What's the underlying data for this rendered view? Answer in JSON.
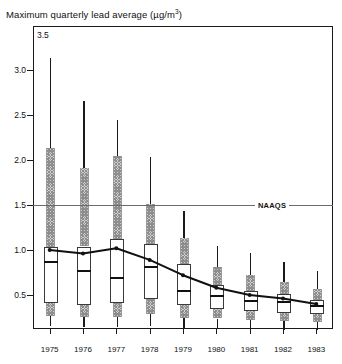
{
  "chart_data": {
    "type": "boxplot",
    "title_main": "Maximum quarterly lead average (µg/m",
    "title_sup": "3",
    "title_tail": ")",
    "xlabel": "",
    "ylabel": "Maximum quarterly lead average (µg/m3)",
    "ylim": [
      0,
      3.5
    ],
    "yticks": [
      3.5,
      3.0,
      2.5,
      2.0,
      1.5,
      1.0,
      0.5
    ],
    "ytick_labels": [
      "3.5",
      "3.0",
      "2.5",
      "2.0",
      "1.5",
      "1.0",
      "0.5"
    ],
    "categories": [
      "1975",
      "1976",
      "1977",
      "1978",
      "1979",
      "1980",
      "1981",
      "1982",
      "1983"
    ],
    "grid": false,
    "legend_position": "none",
    "annotations": [
      {
        "name": "NAAQS",
        "label": "NAAQS",
        "type": "hline",
        "value": 1.5,
        "color": "#6b6b6b"
      }
    ],
    "boxes": [
      {
        "category": "1975",
        "whisker_high": 3.15,
        "band_high": 2.15,
        "q3": 1.05,
        "median": 0.88,
        "q1": 0.42,
        "band_low": 0.28,
        "whisker_low": 0.17
      },
      {
        "category": "1976",
        "whisker_high": 2.67,
        "band_high": 1.92,
        "q3": 1.05,
        "median": 0.78,
        "q1": 0.4,
        "band_low": 0.27,
        "whisker_low": 0.16
      },
      {
        "category": "1977",
        "whisker_high": 2.46,
        "band_high": 2.06,
        "q3": 1.13,
        "median": 0.7,
        "q1": 0.42,
        "band_low": 0.27,
        "whisker_low": 0.15
      },
      {
        "category": "1978",
        "whisker_high": 2.05,
        "band_high": 1.52,
        "q3": 1.08,
        "median": 0.82,
        "q1": 0.47,
        "band_low": 0.3,
        "whisker_low": 0.17
      },
      {
        "category": "1979",
        "whisker_high": 1.45,
        "band_high": 1.14,
        "q3": 0.86,
        "median": 0.56,
        "q1": 0.4,
        "band_low": 0.26,
        "whisker_low": 0.14
      },
      {
        "category": "1980",
        "whisker_high": 1.06,
        "band_high": 0.82,
        "q3": 0.62,
        "median": 0.5,
        "q1": 0.36,
        "band_low": 0.25,
        "whisker_low": 0.14
      },
      {
        "category": "1981",
        "whisker_high": 0.98,
        "band_high": 0.73,
        "q3": 0.56,
        "median": 0.45,
        "q1": 0.33,
        "band_low": 0.23,
        "whisker_low": 0.13
      },
      {
        "category": "1982",
        "whisker_high": 0.88,
        "band_high": 0.66,
        "q3": 0.52,
        "median": 0.43,
        "q1": 0.31,
        "band_low": 0.22,
        "whisker_low": 0.12
      },
      {
        "category": "1983",
        "whisker_high": 0.78,
        "band_high": 0.58,
        "q3": 0.46,
        "median": 0.39,
        "q1": 0.3,
        "band_low": 0.21,
        "whisker_low": 0.12
      }
    ],
    "series": [
      {
        "name": "mean",
        "type": "line",
        "marker": "dot",
        "color": "#111111",
        "x": [
          "1975",
          "1976",
          "1977",
          "1978",
          "1979",
          "1980",
          "1981",
          "1982",
          "1983"
        ],
        "values": [
          1.0,
          0.96,
          1.02,
          0.89,
          0.72,
          0.58,
          0.5,
          0.46,
          0.4
        ]
      }
    ],
    "colors": {
      "box_fill": "#ffffff",
      "box_stroke": "#3a3a3a",
      "median": "#111111",
      "whisker": "#1a1a1a",
      "hatch_band": "#bdbdbd",
      "naaqs_line": "#6b6b6b",
      "frame": "#1a1a1a"
    }
  }
}
